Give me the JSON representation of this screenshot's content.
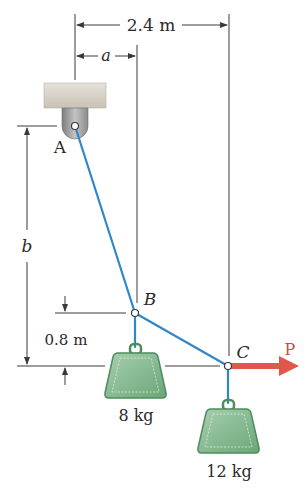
{
  "diagram": {
    "type": "statics-cable-system",
    "colors": {
      "cable": "#2f86c8",
      "force_arrow": "#e2574c",
      "weight_fill": "#7fb58a",
      "weight_edge": "#4e8c5c",
      "support_block": "#d8d2c8",
      "bracket": "#9a9a9a",
      "dimension_lines": "#3a3a3a"
    },
    "points": {
      "A": {
        "label": "A",
        "x": 75,
        "y": 126
      },
      "B": {
        "label": "B",
        "x": 135,
        "y": 313
      },
      "C": {
        "label": "C",
        "x": 228,
        "y": 366
      }
    },
    "dimensions": {
      "horizontal_total": "2.4 m",
      "horizontal_a": "a",
      "vertical_b": "b",
      "vertical_bc": "0.8 m"
    },
    "masses": [
      {
        "label": "8 kg",
        "at": "B"
      },
      {
        "label": "12 kg",
        "at": "C"
      }
    ],
    "force": {
      "label": "P",
      "direction": "right",
      "at": "C"
    }
  }
}
